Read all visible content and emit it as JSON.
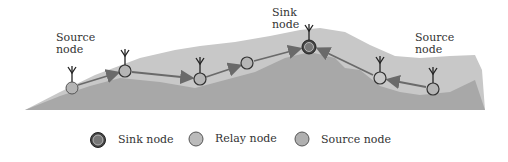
{
  "labels": {
    "source_left": "Source\nnode",
    "sink_top": "Sink\nnode",
    "source_right": "Source\nnode"
  },
  "legend": {
    "sink": "Sink node",
    "relay": "Relay node",
    "source": "Source node"
  },
  "nodes": [
    {
      "type": "source",
      "x": 72,
      "y": 88
    },
    {
      "type": "relay",
      "x": 125,
      "y": 71
    },
    {
      "type": "relay",
      "x": 200,
      "y": 79
    },
    {
      "type": "relay",
      "x": 247,
      "y": 63
    },
    {
      "type": "sink",
      "x": 309,
      "y": 47
    },
    {
      "type": "relay",
      "x": 380,
      "y": 78
    },
    {
      "type": "source",
      "x": 433,
      "y": 89
    }
  ],
  "colors": {
    "terrain_light": "#c8c8c8",
    "terrain_dark": "#a8a8a8",
    "node_fill": "#b5b5b5",
    "sink_fill": "#777777",
    "arrow": "#6a6a6a",
    "outline": "#333333"
  }
}
